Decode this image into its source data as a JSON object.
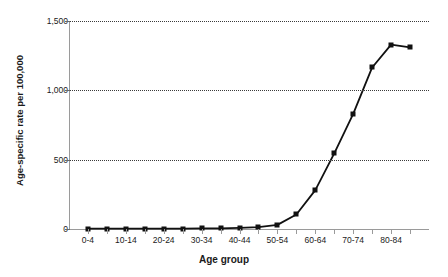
{
  "chart_data": {
    "type": "line",
    "title": "",
    "xlabel": "Age group",
    "ylabel": "Age-specific rate per 100,000",
    "ylim": [
      0,
      1500
    ],
    "yticks": [
      0,
      500,
      1000,
      1500
    ],
    "ytick_labels": [
      "0",
      "500",
      "1,000",
      "1,500"
    ],
    "grid": true,
    "legend": "none",
    "categories": [
      "0-4",
      "5-9",
      "10-14",
      "15-19",
      "20-24",
      "25-29",
      "30-34",
      "35-39",
      "40-44",
      "45-49",
      "50-54",
      "55-59",
      "60-64",
      "65-69",
      "70-74",
      "75-79",
      "80-84",
      "85+"
    ],
    "xtick_labels_shown": [
      "0-4",
      "10-14",
      "20-24",
      "30-34",
      "40-44",
      "50-54",
      "60-64",
      "70-74",
      "80-84"
    ],
    "series": [
      {
        "name": "Age-specific rate",
        "marker": "square",
        "color": "#111111",
        "values": [
          2,
          2,
          2,
          2,
          3,
          3,
          4,
          5,
          8,
          14,
          30,
          105,
          280,
          545,
          830,
          1165,
          1330,
          1310
        ]
      }
    ]
  },
  "axis": {
    "y_title": "Age-specific rate per 100,000",
    "x_title": "Age group"
  }
}
